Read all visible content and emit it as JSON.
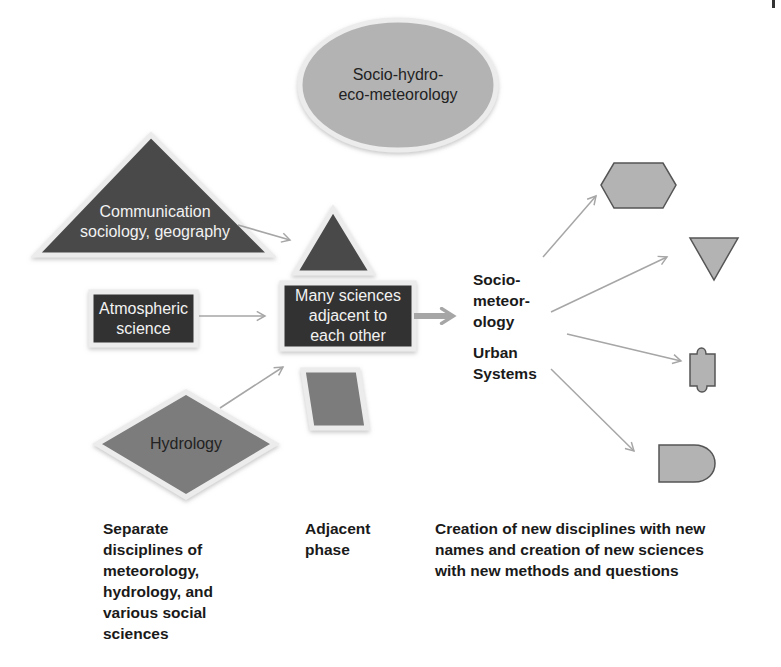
{
  "diagram": {
    "colors": {
      "dark_fill": "#4a4a4a",
      "medium_fill": "#7b7b7b",
      "light_fill": "#b3b3b3",
      "arrow": "#a6a6a6",
      "outline": "#555555",
      "halo": "#ececec"
    },
    "nodes": {
      "ellipse": {
        "label": "Socio-hydro-\neco-meteorology",
        "shape": "ellipse"
      },
      "communication": {
        "label": "Communication\nsociology, geography",
        "shape": "triangle"
      },
      "atmospheric": {
        "label": "Atmospheric\nscience",
        "shape": "rectangle"
      },
      "hydrology": {
        "label": "Hydrology",
        "shape": "diamond"
      },
      "center_box": {
        "label": "Many sciences\nadjacent to\neach other",
        "shape": "rectangle"
      },
      "center_triangle": {
        "shape": "triangle"
      },
      "center_parallelogram": {
        "shape": "parallelogram"
      },
      "socio_meteorology": {
        "label": "Socio-\nmeteor-\nology"
      },
      "urban_systems": {
        "label": "Urban\nSystems"
      },
      "out_hexagon": {
        "shape": "hexagon"
      },
      "out_inverted_triangle": {
        "shape": "inverted-triangle"
      },
      "out_tape": {
        "shape": "punched-tape"
      },
      "out_delay": {
        "shape": "delay"
      }
    },
    "captions": {
      "left": "Separate\ndisciplines of\nmeteorology,\nhydrology, and\nvarious social\nsciences",
      "middle": "Adjacent\nphase",
      "right": "Creation of new disciplines with new\nnames and creation of new sciences\nwith new methods and questions"
    }
  }
}
